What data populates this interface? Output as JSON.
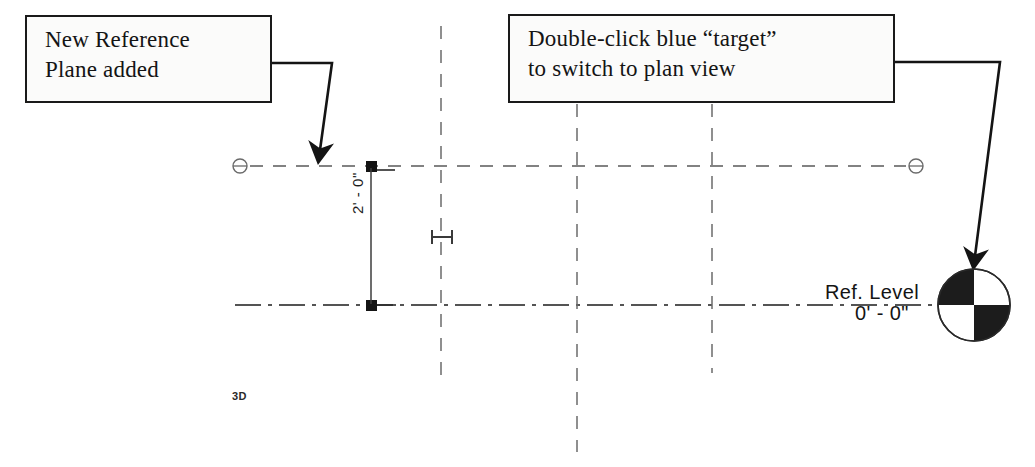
{
  "document": {
    "title": "Revit reference plane and level view annotation",
    "background_color": "#ffffff",
    "ink_color": "#141414"
  },
  "callouts": [
    {
      "id": "callout-ref-plane",
      "name": "new-reference-plane-callout",
      "lines": [
        "New Reference",
        "Plane added"
      ],
      "points_to": "reference-plane-grip"
    },
    {
      "id": "callout-target",
      "name": "double-click-target-callout",
      "lines": [
        "Double-click blue “target”",
        "to switch to plan view"
      ],
      "points_to": "plan-view-target"
    }
  ],
  "drawing": {
    "level": {
      "name": "Ref. Level",
      "elevation": "0' - 0\""
    },
    "dimension": {
      "value": "2' - 0\"",
      "orientation": "vertical"
    },
    "view_tag": "3D",
    "reference_plane": {
      "label": "",
      "end_handles": 2
    },
    "target": {
      "quadrants": [
        "black",
        "white",
        "white",
        "black"
      ],
      "description": "plan view target"
    }
  },
  "icons": {
    "drag_circle": "circle-grip-icon",
    "square_grip": "square-grip-icon",
    "flip_control": "dimension-flip-icon",
    "arrow": "leader-arrow-icon"
  }
}
